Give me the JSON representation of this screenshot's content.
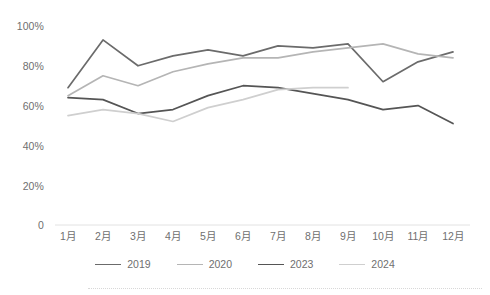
{
  "chart_data": {
    "type": "line",
    "title": "",
    "subtitle": "",
    "xlabel": "",
    "ylabel": "",
    "ylim": [
      0,
      100
    ],
    "yticks": [
      0,
      20,
      40,
      60,
      80,
      100
    ],
    "ytick_labels": [
      "0",
      "20%",
      "40%",
      "60%",
      "80%",
      "100%"
    ],
    "grid": false,
    "legend_position": "bottom",
    "categories": [
      "1月",
      "2月",
      "3月",
      "4月",
      "5月",
      "6月",
      "7月",
      "8月",
      "9月",
      "10月",
      "11月",
      "12月"
    ],
    "series": [
      {
        "name": "2019",
        "color": "#6b6b6b",
        "values": [
          69,
          93,
          80,
          85,
          88,
          85,
          90,
          89,
          91,
          72,
          82,
          87
        ]
      },
      {
        "name": "2020",
        "color": "#b5b5b5",
        "values": [
          65,
          75,
          70,
          77,
          81,
          84,
          84,
          87,
          89,
          91,
          86,
          84
        ]
      },
      {
        "name": "2023",
        "color": "#555555",
        "values": [
          64,
          63,
          56,
          58,
          65,
          70,
          69,
          66,
          63,
          58,
          60,
          51
        ]
      },
      {
        "name": "2024",
        "color": "#cfcfcf",
        "values": [
          55,
          58,
          56,
          52,
          59,
          63,
          68,
          69,
          69,
          null,
          null,
          null
        ]
      }
    ]
  },
  "legend": {
    "items": [
      {
        "label": "2019",
        "color": "#6b6b6b"
      },
      {
        "label": "2020",
        "color": "#b5b5b5"
      },
      {
        "label": "2023",
        "color": "#555555"
      },
      {
        "label": "2024",
        "color": "#cfcfcf"
      }
    ]
  },
  "axes": {
    "y_tick_labels": [
      "100%",
      "80%",
      "60%",
      "40%",
      "20%",
      "0"
    ],
    "x_tick_labels": [
      "1月",
      "2月",
      "3月",
      "4月",
      "5月",
      "6月",
      "7月",
      "8月",
      "9月",
      "10月",
      "11月",
      "12月"
    ]
  }
}
